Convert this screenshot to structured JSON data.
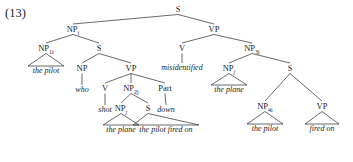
{
  "example": {
    "number": "(13)"
  },
  "tree": {
    "nodes": [
      {
        "id": "S-root",
        "label": "S",
        "sub": "",
        "x": 178,
        "y": 11
      },
      {
        "id": "NP-i",
        "label": "NP",
        "sub": "i",
        "x": 73,
        "y": 31
      },
      {
        "id": "VP-top",
        "label": "VP",
        "sub": "",
        "x": 214,
        "y": 31
      },
      {
        "id": "NP-1i",
        "label": "NP",
        "sub": "1i",
        "x": 46,
        "y": 50
      },
      {
        "id": "S-rel",
        "label": "S",
        "sub": "",
        "x": 99,
        "y": 50
      },
      {
        "id": "V-mis",
        "label": "V",
        "sub": "",
        "x": 182,
        "y": 50
      },
      {
        "id": "NP-3j",
        "label": "NP",
        "sub": "3j",
        "x": 252,
        "y": 50
      },
      {
        "id": "NP-who",
        "label": "NP",
        "sub": "",
        "x": 82,
        "y": 70
      },
      {
        "id": "VP-rel",
        "label": "VP",
        "sub": "",
        "x": 131,
        "y": 70
      },
      {
        "id": "NP-j",
        "label": "NP",
        "sub": "j",
        "x": 229,
        "y": 70
      },
      {
        "id": "S-low",
        "label": "S",
        "sub": "",
        "x": 290,
        "y": 70
      },
      {
        "id": "V-shot",
        "label": "V",
        "sub": "",
        "x": 105,
        "y": 90
      },
      {
        "id": "NP-2j",
        "label": "NP",
        "sub": "2j",
        "x": 131,
        "y": 90
      },
      {
        "id": "Part",
        "label": "Part",
        "sub": "",
        "x": 165,
        "y": 90
      },
      {
        "id": "NP-4i",
        "label": "NP",
        "sub": "4i",
        "x": 265,
        "y": 108
      },
      {
        "id": "VP-low",
        "label": "VP",
        "sub": "",
        "x": 322,
        "y": 108
      },
      {
        "id": "NP-j2",
        "label": "NP",
        "sub": "j",
        "x": 121,
        "y": 110
      },
      {
        "id": "S-cp",
        "label": "S",
        "sub": "",
        "x": 148,
        "y": 110
      }
    ],
    "leaves": [
      {
        "id": "leaf-the-pilot-1",
        "text": "the pilot",
        "x": 46,
        "y": 73
      },
      {
        "id": "leaf-who",
        "text": "who",
        "x": 82,
        "y": 92
      },
      {
        "id": "leaf-shot",
        "text": "shot",
        "x": 105,
        "y": 112
      },
      {
        "id": "leaf-down",
        "text": "down",
        "x": 166,
        "y": 112
      },
      {
        "id": "leaf-misidentified",
        "text": "misidentified",
        "x": 182,
        "y": 70
      },
      {
        "id": "leaf-the-plane-1",
        "text": "the plane",
        "x": 121,
        "y": 132
      },
      {
        "id": "leaf-the-pilot-fired-on",
        "text": "the pilot fired on",
        "x": 166,
        "y": 132
      },
      {
        "id": "leaf-the-plane-2",
        "text": "the plane",
        "x": 229,
        "y": 92
      },
      {
        "id": "leaf-the-pilot-2",
        "text": "the pilot",
        "x": 265,
        "y": 131
      },
      {
        "id": "leaf-fired-on",
        "text": "fired on",
        "x": 322,
        "y": 131
      }
    ],
    "branches": [
      {
        "from": "S-root",
        "to": "NP-i"
      },
      {
        "from": "S-root",
        "to": "VP-top"
      },
      {
        "from": "NP-i",
        "to": "NP-1i"
      },
      {
        "from": "NP-i",
        "to": "S-rel"
      },
      {
        "from": "VP-top",
        "to": "V-mis"
      },
      {
        "from": "VP-top",
        "to": "NP-3j"
      },
      {
        "from": "S-rel",
        "to": "NP-who"
      },
      {
        "from": "S-rel",
        "to": "VP-rel"
      },
      {
        "from": "NP-3j",
        "to": "NP-j"
      },
      {
        "from": "NP-3j",
        "to": "S-low"
      },
      {
        "from": "VP-rel",
        "to": "V-shot"
      },
      {
        "from": "VP-rel",
        "to": "NP-2j"
      },
      {
        "from": "VP-rel",
        "to": "Part"
      },
      {
        "from": "S-low",
        "to": "NP-4i"
      },
      {
        "from": "S-low",
        "to": "VP-low"
      },
      {
        "from": "NP-2j",
        "to": "NP-j2"
      },
      {
        "from": "NP-2j",
        "to": "S-cp"
      }
    ],
    "stems": [
      {
        "id": "stem-who",
        "from": "NP-who",
        "to": "leaf-who"
      },
      {
        "id": "stem-shot",
        "from": "V-shot",
        "to": "leaf-shot"
      },
      {
        "id": "stem-down",
        "from": "Part",
        "to": "leaf-down"
      },
      {
        "id": "stem-misidentified",
        "from": "V-mis",
        "to": "leaf-misidentified"
      }
    ],
    "triangles": [
      {
        "id": "tri-the-pilot-1",
        "node": "NP-1i",
        "leaf": "leaf-the-pilot-1",
        "half": 18
      },
      {
        "id": "tri-the-plane-1",
        "node": "NP-j2",
        "leaf": "leaf-the-plane-1",
        "half": 18
      },
      {
        "id": "tri-the-pilot-fired-on",
        "node": "S-cp",
        "leaf": "leaf-the-pilot-fired-on",
        "half": 33
      },
      {
        "id": "tri-the-plane-2",
        "node": "NP-j",
        "leaf": "leaf-the-plane-2",
        "half": 18
      },
      {
        "id": "tri-the-pilot-2",
        "node": "NP-4i",
        "leaf": "leaf-the-pilot-2",
        "half": 18
      },
      {
        "id": "tri-fired-on",
        "node": "VP-low",
        "leaf": "leaf-fired-on",
        "half": 17
      }
    ]
  }
}
